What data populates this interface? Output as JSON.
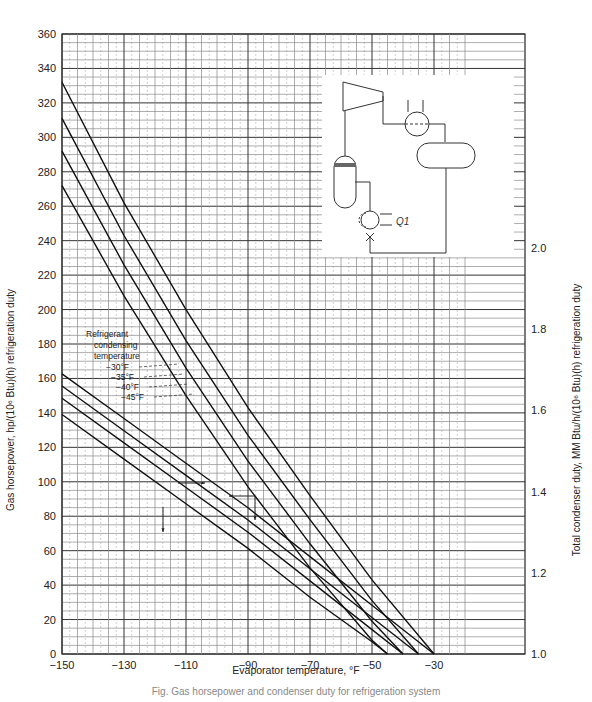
{
  "chart_data": {
    "type": "line",
    "title": "",
    "caption": "Fig. Gas horsepower and condenser duty for refrigeration system",
    "xlabel": "Evaporator temperature, °F",
    "ylabel": "Gas horsepower, hp/(10⁶ Btu)(h) refrigeration duty",
    "y2label": "Total condenser duty, MM Btu/h/(10⁶ Btu)(h) refrigeration duty",
    "xlim": [
      -150,
      -20
    ],
    "ylim": [
      0,
      360
    ],
    "y2lim": [
      1.0,
      2.0
    ],
    "grid": true,
    "x_ticks": [
      "−150",
      "−130",
      "−110",
      "−90",
      "−70",
      "−50",
      "−30"
    ],
    "y_ticks": [
      "0",
      "20",
      "40",
      "60",
      "80",
      "100",
      "120",
      "140",
      "160",
      "180",
      "200",
      "220",
      "240",
      "260",
      "280",
      "300",
      "320",
      "340",
      "360"
    ],
    "y2_ticks": [
      "1.0",
      "1.2",
      "1.4",
      "1.6",
      "1.8",
      "2.0"
    ],
    "legend": {
      "title_lines": [
        "Refrigerant",
        "condensing",
        "temperature"
      ],
      "entries": [
        "−30°F",
        "−35°F",
        "−40°F",
        "−45°F"
      ],
      "position": "left-middle"
    },
    "annotations": [
      {
        "text": "arrow → right axis",
        "near_x": -120,
        "near_y": 100
      },
      {
        "text": "arrow ← left axis",
        "near_x": -100,
        "near_y": 95
      },
      {
        "text": "arrow ↓",
        "near_x": -130,
        "near_y": 85
      },
      {
        "text": "arrow ↓",
        "near_x": -98,
        "near_y": 88
      }
    ],
    "series": [
      {
        "name": "Gas horsepower, −30°F condensing",
        "axis": "left",
        "x": [
          -150,
          -130,
          -110,
          -90,
          -70,
          -50,
          -30
        ],
        "values": [
          332,
          262,
          200,
          143,
          92,
          43,
          0
        ]
      },
      {
        "name": "Gas horsepower, −35°F condensing",
        "axis": "left",
        "x": [
          -150,
          -130,
          -110,
          -90,
          -70,
          -50,
          -35
        ],
        "values": [
          311,
          243,
          182,
          127,
          78,
          31,
          0
        ]
      },
      {
        "name": "Gas horsepower, −40°F condensing",
        "axis": "left",
        "x": [
          -150,
          -130,
          -110,
          -90,
          -70,
          -50,
          -40
        ],
        "values": [
          292,
          226,
          166,
          112,
          64,
          19,
          0
        ]
      },
      {
        "name": "Gas horsepower, −45°F condensing",
        "axis": "left",
        "x": [
          -150,
          -130,
          -110,
          -90,
          -70,
          -50,
          -45
        ],
        "values": [
          272,
          208,
          150,
          97,
          50,
          8,
          0
        ]
      },
      {
        "name": "Condenser duty, −30°F condensing",
        "axis": "right",
        "x": [
          -150,
          -130,
          -110,
          -90,
          -70,
          -50,
          -30
        ],
        "values": [
          1.69,
          1.58,
          1.47,
          1.36,
          1.24,
          1.12,
          1.0
        ]
      },
      {
        "name": "Condenser duty, −35°F condensing",
        "axis": "right",
        "x": [
          -150,
          -130,
          -110,
          -90,
          -70,
          -50,
          -35
        ],
        "values": [
          1.66,
          1.55,
          1.44,
          1.33,
          1.21,
          1.09,
          1.0
        ]
      },
      {
        "name": "Condenser duty, −40°F condensing",
        "axis": "right",
        "x": [
          -150,
          -130,
          -110,
          -90,
          -70,
          -50,
          -40
        ],
        "values": [
          1.63,
          1.52,
          1.41,
          1.3,
          1.18,
          1.06,
          1.0
        ]
      },
      {
        "name": "Condenser duty, −45°F condensing",
        "axis": "right",
        "x": [
          -150,
          -130,
          -110,
          -90,
          -70,
          -50,
          -45
        ],
        "values": [
          1.59,
          1.48,
          1.37,
          1.26,
          1.14,
          1.03,
          1.0
        ]
      }
    ],
    "inset": {
      "description": "Refrigeration cycle schematic: compressor, condenser exchanger, accumulator drum, suction scrubber, chiller",
      "label": "Q1"
    }
  }
}
